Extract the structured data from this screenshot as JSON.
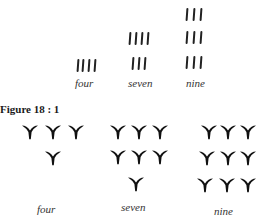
{
  "figure": {
    "caption": "Figure 18 : 1",
    "top_group": {
      "description": "Tally-stroke numerals",
      "items": [
        {
          "label": "four",
          "value": 4
        },
        {
          "label": "seven",
          "value": 7
        },
        {
          "label": "nine",
          "value": 9
        }
      ]
    },
    "bottom_group": {
      "description": "Cuneiform wedge numerals",
      "items": [
        {
          "label": "four",
          "value": 4
        },
        {
          "label": "seven",
          "value": 7
        },
        {
          "label": "nine",
          "value": 9
        }
      ]
    }
  }
}
